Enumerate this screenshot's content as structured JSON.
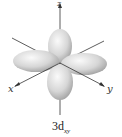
{
  "diagram": {
    "title_main": "3d",
    "title_sub": "xy",
    "axes": {
      "z": "z",
      "x": "x",
      "y": "y"
    },
    "colors": {
      "lobe_light": "#f4f4f4",
      "lobe_mid": "#cfcfcf",
      "lobe_dark": "#9a9a9a",
      "axis": "#333333"
    }
  }
}
